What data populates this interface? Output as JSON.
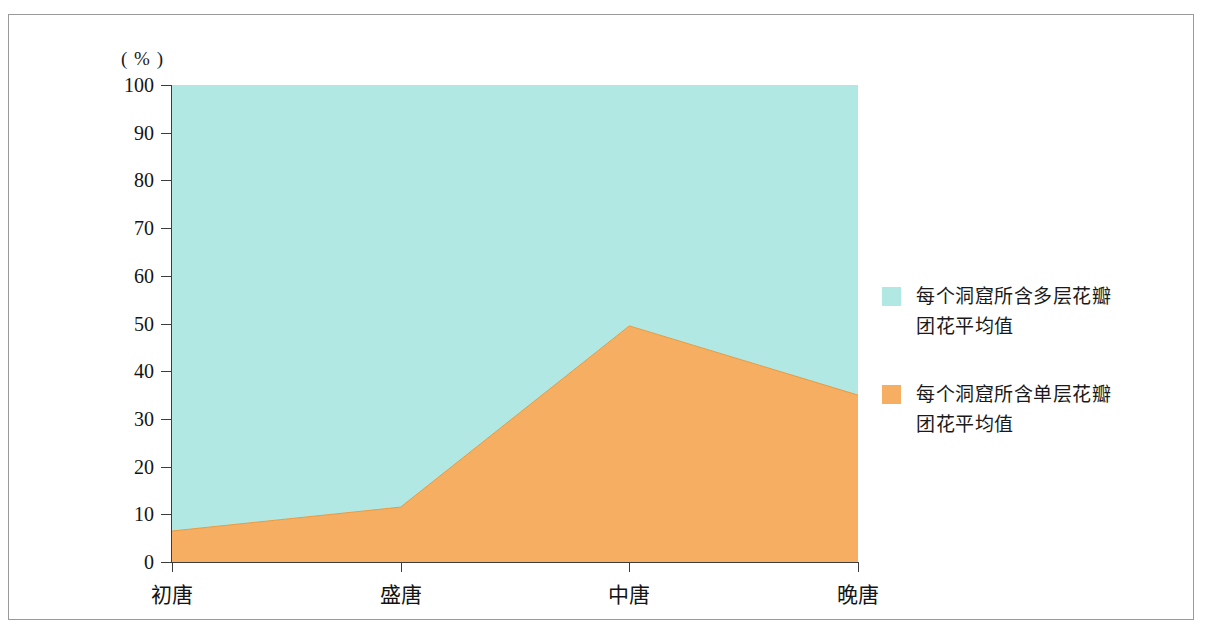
{
  "figure": {
    "frame_border_color": "#9a9a9a",
    "background": "#ffffff"
  },
  "axes": {
    "y_unit_label": "( % )",
    "y_ticks": [
      "100",
      "90",
      "80",
      "70",
      "60",
      "50",
      "40",
      "30",
      "20",
      "10",
      "0"
    ],
    "x_ticks": [
      "初唐",
      "盛唐",
      "中唐",
      "晚唐"
    ]
  },
  "legend": {
    "items": [
      {
        "label": "每个洞窟所含多层花瓣团花平均值",
        "line1": "每个洞窟所含多层花瓣",
        "line2": "团花平均值",
        "color": "#b2e8e4",
        "swatch_name": "legend-swatch-multi-layer"
      },
      {
        "label": "每个洞窟所含单层花瓣团花平均值",
        "line1": "每个洞窟所含单层花瓣",
        "line2": "团花平均值",
        "color": "#f5ae62",
        "swatch_name": "legend-swatch-single-layer"
      }
    ]
  },
  "chart_data": {
    "type": "area",
    "stacked": true,
    "normalized_percent": true,
    "title": "",
    "subtitle": "",
    "xlabel": "",
    "ylabel": "( % )",
    "ylim": [
      0,
      100
    ],
    "ytick_step": 10,
    "grid": false,
    "legend_position": "right",
    "categories": [
      "初唐",
      "盛唐",
      "中唐",
      "晚唐"
    ],
    "series": [
      {
        "name": "每个洞窟所含单层花瓣团花平均值",
        "color": "#f5ae62",
        "stack_order": 1,
        "values": [
          6.5,
          11.5,
          49.5,
          35
        ]
      },
      {
        "name": "每个洞窟所含多层花瓣团花平均值",
        "color": "#b2e8e4",
        "stack_order": 2,
        "values": [
          93.5,
          88.5,
          50.5,
          65
        ]
      }
    ],
    "annotations": []
  }
}
